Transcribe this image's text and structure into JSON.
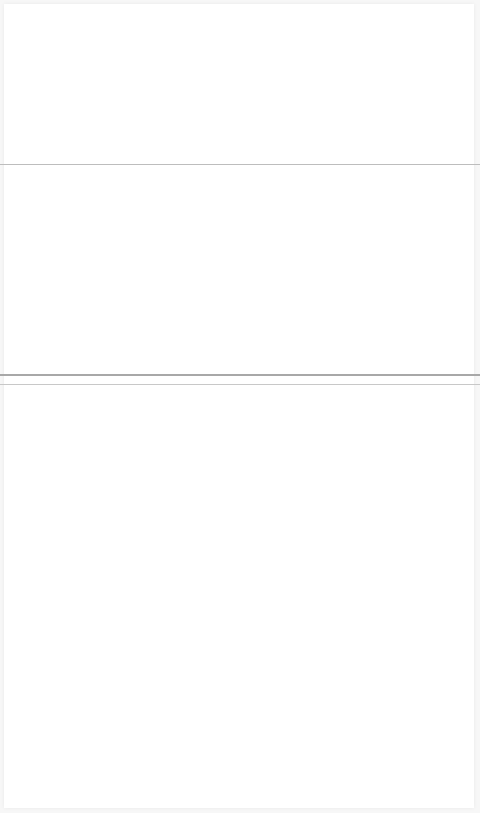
{
  "page": {
    "background": "#ffffff",
    "frame_color": "#f7f7f7"
  },
  "sections": [
    {
      "name": "top",
      "content": ""
    },
    {
      "name": "middle",
      "content": ""
    },
    {
      "name": "bottom",
      "content": ""
    }
  ],
  "dividers": [
    {
      "y": 164,
      "color": "#bdbdbd"
    },
    {
      "y": 375,
      "color": "#a8a8a8"
    },
    {
      "y": 384,
      "color": "#c8c8c8"
    }
  ]
}
